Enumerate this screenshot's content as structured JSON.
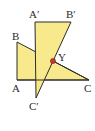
{
  "diagram": {
    "type": "geometry-rotation",
    "colors": {
      "fill": "#f8ea8c",
      "stroke": "#2b2b2b",
      "point": "#c0392b",
      "background": "#ffffff"
    },
    "triangles": [
      {
        "name": "ABC",
        "vertices": {
          "A": [
            17,
            80
          ],
          "B": [
            17,
            42
          ],
          "C": [
            89,
            80
          ]
        }
      },
      {
        "name": "A'B'C'",
        "vertices": {
          "A'": [
            35,
            22
          ],
          "B'": [
            71,
            22
          ],
          "C'": [
            36,
            98
          ]
        }
      }
    ],
    "intersection": {
      "name": "Y",
      "point": [
        53,
        61
      ]
    },
    "labels": {
      "A": "A",
      "B": "B",
      "C": "C",
      "A_prime": "A′",
      "B_prime": "B′",
      "C_prime": "C′",
      "Y": "Y"
    }
  }
}
